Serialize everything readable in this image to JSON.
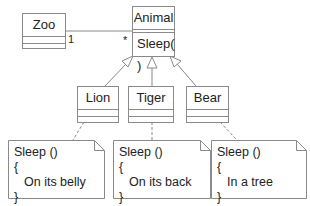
{
  "diagram": {
    "type": "uml-class-diagram",
    "classes": {
      "zoo": {
        "name": "Zoo"
      },
      "animal": {
        "name": "Animal",
        "operation": "Sleep( )"
      },
      "lion": {
        "name": "Lion"
      },
      "tiger": {
        "name": "Tiger"
      },
      "bear": {
        "name": "Bear"
      }
    },
    "association": {
      "from": "Zoo",
      "to": "Animal",
      "from_multiplicity": "1",
      "to_multiplicity": "*"
    },
    "generalizations": [
      {
        "child": "Lion",
        "parent": "Animal"
      },
      {
        "child": "Tiger",
        "parent": "Animal"
      },
      {
        "child": "Bear",
        "parent": "Animal"
      }
    ],
    "notes": [
      {
        "attached_to": "Lion",
        "line1": "Sleep ()",
        "line2": "{",
        "line3": "On its belly",
        "line4": "}"
      },
      {
        "attached_to": "Tiger",
        "line1": "Sleep ()",
        "line2": "{",
        "line3": "On its back",
        "line4": "}"
      },
      {
        "attached_to": "Bear",
        "line1": "Sleep ()",
        "line2": "{",
        "line3": "In a tree",
        "line4": "}"
      }
    ],
    "colors": {
      "line": "#8a8a8a",
      "text": "#222222",
      "background": "#ffffff"
    }
  }
}
